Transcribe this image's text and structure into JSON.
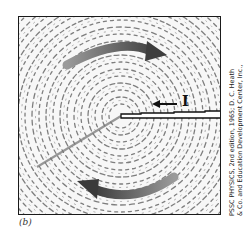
{
  "figure": {
    "panel_label": "(b)",
    "current_label": "I",
    "credit_line_1": "PSSC PHYSICS, 2nd edition, 1965; D. C. Heath",
    "credit_line_2": "& Co. and Education Development Center, Inc.,",
    "colors": {
      "frame": "#1a1a1a",
      "filings": "#555555",
      "field_arrows": "#555555",
      "background": "#f7f7f7"
    }
  }
}
